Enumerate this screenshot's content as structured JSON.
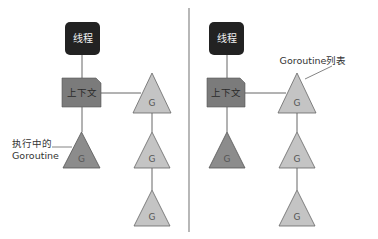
{
  "colors": {
    "thread_fill": "#222222",
    "context_fill": "#7b7b7b",
    "running_g_fill": "#8c8c8c",
    "queued_g_fill": "#c4c4c4",
    "line": "#666666",
    "divider": "#888888"
  },
  "left_panel": {
    "thread_label": "线程",
    "context_label": "上下文",
    "running_g_label": "G",
    "running_annotation_line1": "执行中的",
    "running_annotation_line2": "Goroutine",
    "queue": [
      "G",
      "G",
      "G"
    ]
  },
  "right_panel": {
    "thread_label": "线程",
    "context_label": "上下文",
    "running_g_label": "G",
    "queue_annotation": "Goroutine列表",
    "queue": [
      "G",
      "G",
      "G"
    ]
  }
}
